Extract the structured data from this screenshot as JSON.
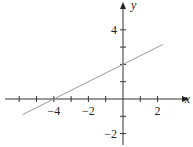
{
  "chart_data": {
    "type": "line",
    "title": "",
    "xlabel": "x",
    "ylabel": "y",
    "xlim": [
      -7,
      3.5
    ],
    "ylim": [
      -2.7,
      5.5
    ],
    "xticks": [
      -6,
      -5,
      -4,
      -3,
      -2,
      -1,
      1,
      2
    ],
    "xtick_labels": [
      {
        "v": -4,
        "t": "−4"
      },
      {
        "v": -2,
        "t": "−2"
      },
      {
        "v": 2,
        "t": "2"
      }
    ],
    "yticks": [
      -2,
      -1,
      1,
      2,
      3,
      4
    ],
    "ytick_labels": [
      {
        "v": 4,
        "t": "4"
      },
      {
        "v": -2,
        "t": "−2"
      }
    ],
    "grid": false,
    "series": [
      {
        "name": "line",
        "x": [
          -5.8,
          2.3
        ],
        "y": [
          -0.9,
          3.15
        ],
        "color": "#999999"
      }
    ],
    "slope": 0.5,
    "y_intercept": 2,
    "x_intercept": -4
  },
  "labels": {
    "x_axis": "x",
    "y_axis": "y"
  }
}
